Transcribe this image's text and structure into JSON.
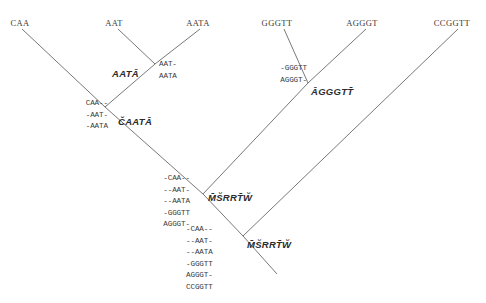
{
  "figure": {
    "type": "phylogenetic-tree-with-progressive-alignment",
    "width": 486,
    "height": 303,
    "line_color": "#555555",
    "text_color": "#3a3a3a",
    "background": "#ffffff"
  },
  "leaves": [
    {
      "id": "leaf-caa",
      "label": "CAA",
      "x": 20,
      "y": 18
    },
    {
      "id": "leaf-aat",
      "label": "AAT",
      "x": 114,
      "y": 18
    },
    {
      "id": "leaf-aata",
      "label": "AATA",
      "x": 198,
      "y": 18
    },
    {
      "id": "leaf-gggtt",
      "label": "GGGTT",
      "x": 277,
      "y": 18
    },
    {
      "id": "leaf-agggt",
      "label": "AGGGT",
      "x": 362,
      "y": 18
    },
    {
      "id": "leaf-ccggtt",
      "label": "CCGGTT",
      "x": 452,
      "y": 18
    }
  ],
  "internal_nodes": [
    {
      "id": "node-aata",
      "label": "AATĀ",
      "x": 139,
      "y": 68,
      "anchor": "right"
    },
    {
      "id": "node-caata",
      "label": "ČAATĀ",
      "x": 118,
      "y": 116,
      "anchor": "left"
    },
    {
      "id": "node-agggtt",
      "label": "ĀGGGTT̄",
      "x": 311,
      "y": 86,
      "anchor": "left"
    },
    {
      "id": "node-msrrtw-1",
      "label": "M̄S̆RRT̄W̆",
      "x": 208,
      "y": 192,
      "anchor": "left"
    },
    {
      "id": "node-msrrtw-2",
      "label": "M̄S̆RRT̄W̆",
      "x": 247,
      "y": 239,
      "anchor": "left"
    }
  ],
  "alignment_blocks": [
    {
      "id": "aln-aat-aata",
      "align": "left",
      "x": 159,
      "y": 59,
      "rows": [
        "AAT-",
        "AATA"
      ]
    },
    {
      "id": "aln-caa-aat-aata",
      "align": "right",
      "x": 108,
      "y": 98,
      "rows": [
        "CAA--",
        "-AAT-",
        "-AATA"
      ]
    },
    {
      "id": "aln-gggtt-agggt",
      "align": "right",
      "x": 307,
      "y": 63,
      "rows": [
        "-GGGTT",
        "AGGGT-"
      ]
    },
    {
      "id": "aln-five-sequence",
      "align": "right",
      "x": 190,
      "y": 173,
      "rows": [
        "-CAA--",
        "--AAT-",
        "--AATA",
        "-GGGTT",
        "AGGGT-"
      ]
    },
    {
      "id": "aln-six-sequence",
      "align": "left",
      "x": 186,
      "y": 224,
      "rows": [
        "-CAA--",
        "--AAT-",
        "--AATA",
        "-GGGTT",
        "AGGGT-",
        "CCGGTT"
      ]
    }
  ],
  "branches": [
    {
      "id": "branch-caa-to-caata",
      "x1": 22,
      "y1": 29,
      "x2": 105,
      "y2": 107
    },
    {
      "id": "branch-aat-to-aata",
      "x1": 118,
      "y1": 29,
      "x2": 155,
      "y2": 64
    },
    {
      "id": "branch-aata-to-aata",
      "x1": 200,
      "y1": 29,
      "x2": 155,
      "y2": 64
    },
    {
      "id": "branch-aata-to-caata",
      "x1": 155,
      "y1": 64,
      "x2": 105,
      "y2": 107
    },
    {
      "id": "branch-caata-to-root1",
      "x1": 105,
      "y1": 107,
      "x2": 203,
      "y2": 194
    },
    {
      "id": "branch-gggtt-to-agggtt",
      "x1": 284,
      "y1": 29,
      "x2": 308,
      "y2": 83
    },
    {
      "id": "branch-agggt-to-agggtt",
      "x1": 366,
      "y1": 29,
      "x2": 308,
      "y2": 83
    },
    {
      "id": "branch-agggtt-to-root1",
      "x1": 308,
      "y1": 83,
      "x2": 203,
      "y2": 194
    },
    {
      "id": "branch-root1-to-root2",
      "x1": 203,
      "y1": 194,
      "x2": 243,
      "y2": 236
    },
    {
      "id": "branch-ccggtt-to-root2",
      "x1": 458,
      "y1": 29,
      "x2": 243,
      "y2": 236
    },
    {
      "id": "branch-root2-down",
      "x1": 243,
      "y1": 236,
      "x2": 277,
      "y2": 274
    }
  ]
}
